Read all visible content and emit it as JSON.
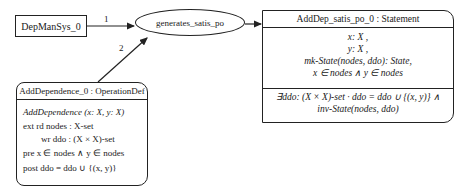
{
  "diagram": {
    "nodes": {
      "depmansys": {
        "label": "DepManSys_0"
      },
      "generator": {
        "label": "generates_satis_po"
      },
      "statement": {
        "title": "AddDep_satis_po_0 : Statement",
        "hypotheses": [
          "x: X ,",
          "y: X ,",
          "mk-State(nodes, ddo): State,",
          "x ∈ nodes ∧ y ∈ nodes"
        ],
        "conclusion": [
          "∃ddo: (X × X)-set · ddo = ddo ∪ {(x, y)} ∧",
          "inv-State(nodes, ddo)"
        ]
      },
      "operation": {
        "title": "AddDependence_0 : OperationDef",
        "signature": "AddDependence (x: X, y: X)",
        "ext_rd": "ext rd nodes  :  X-set",
        "ext_wr": "wr ddo    :  (X × X)-set",
        "pre": "pre x ∈ nodes ∧ y ∈ nodes",
        "post": "post ddo = ddo ∪ {(x, y)}"
      }
    },
    "edges": [
      {
        "from": "DepManSys_0",
        "to": "generates_satis_po",
        "label": "1"
      },
      {
        "from": "AddDependence_0",
        "to": "generates_satis_po",
        "label": "2"
      },
      {
        "from": "generates_satis_po",
        "to": "AddDep_satis_po_0",
        "label": ""
      }
    ]
  }
}
